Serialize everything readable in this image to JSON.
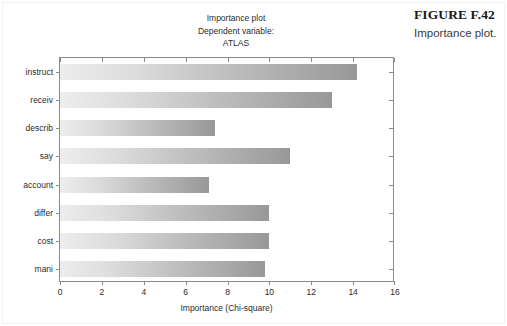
{
  "figure": {
    "caption_title": "FIGURE F.42",
    "caption_subtitle": "Importance plot."
  },
  "chart_data": {
    "type": "bar",
    "orientation": "horizontal",
    "title": "Importance plot",
    "subtitle_line1": "Dependent variable:",
    "subtitle_line2": "ATLAS",
    "xlabel": "Importance (Chi-square)",
    "ylabel": "",
    "xlim": [
      0,
      16
    ],
    "xticks": [
      0,
      2,
      4,
      6,
      8,
      10,
      12,
      14,
      16
    ],
    "xtick_labels": [
      "0",
      "2",
      "4",
      "6",
      "8",
      "10",
      "12",
      "14",
      "16"
    ],
    "grid": false,
    "legend": false,
    "categories": [
      "instruct",
      "receiv",
      "describ",
      "say",
      "account",
      "differ",
      "cost",
      "mani"
    ],
    "values": [
      14.2,
      13.0,
      7.4,
      11.0,
      7.1,
      10.0,
      10.0,
      9.8
    ],
    "bar_gradient_start": "#ededed",
    "bar_gradient_end": "#989898",
    "axis_color": "#8c8c8c"
  }
}
